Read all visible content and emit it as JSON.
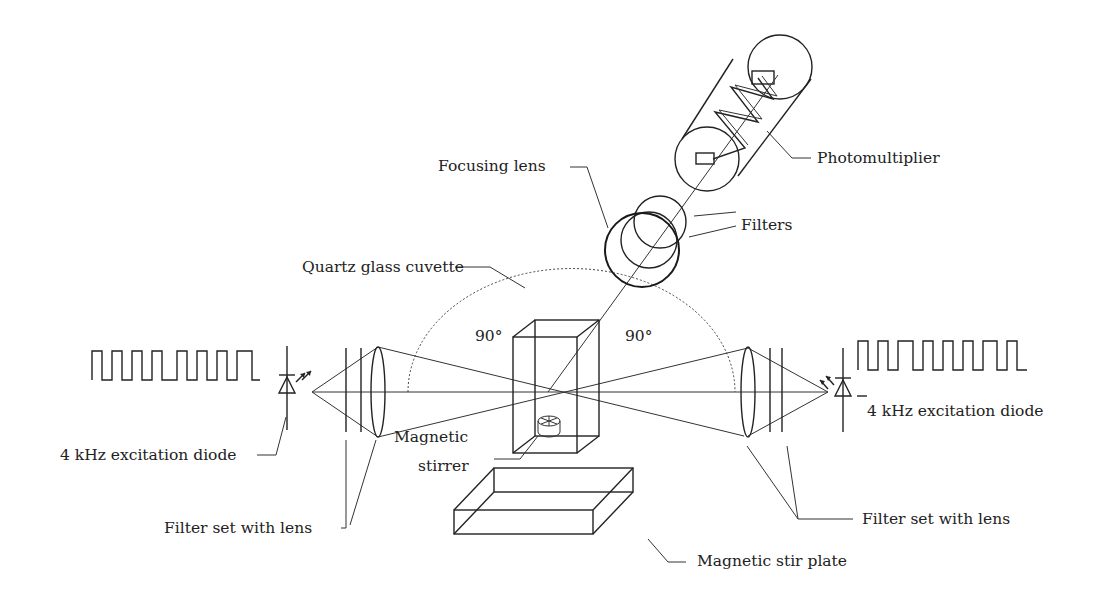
{
  "diagram": {
    "labels": {
      "photomultiplier": "Photomultiplier",
      "focusing_lens": "Focusing lens",
      "filters": "Filters",
      "cuvette": "Quartz glass cuvette",
      "angle_left": "90°",
      "angle_right": "90°",
      "diode_left": "4 kHz excitation diode",
      "diode_right": "4 kHz excitation diode",
      "stirrer_line1": "Magnetic",
      "stirrer_line2": "stirrer",
      "filter_set_left": "Filter set with lens",
      "filter_set_right": "Filter set with lens",
      "stir_plate": "Magnetic stir plate"
    },
    "components": [
      "photomultiplier-tube",
      "focusing-lens",
      "emission-filters",
      "quartz-cuvette",
      "excitation-diode-left",
      "excitation-diode-right",
      "filter-set-left",
      "filter-set-right",
      "magnetic-stirrer",
      "magnetic-stir-plate",
      "square-wave-signal-left",
      "square-wave-signal-right"
    ],
    "colors": {
      "line": "#222222",
      "background": "#ffffff"
    }
  }
}
